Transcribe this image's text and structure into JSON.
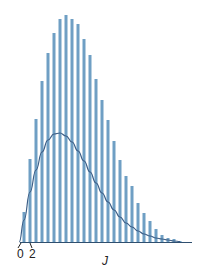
{
  "chart_data": {
    "type": "bar",
    "title": "",
    "xlabel": "J",
    "ylabel": "",
    "x_tick_labels": [
      "0",
      "2"
    ],
    "categories": [
      1,
      2,
      3,
      4,
      5,
      6,
      7,
      8,
      9,
      10,
      11,
      12,
      13,
      14,
      15,
      16,
      17,
      18,
      19,
      20,
      21,
      22,
      23,
      24,
      25,
      26,
      27
    ],
    "series": [
      {
        "name": "bars",
        "type": "bar",
        "color": "#6f9fc4",
        "values": [
          30,
          83,
          123,
          161,
          189,
          209,
          223,
          227,
          223,
          218,
          203,
          187,
          163,
          142,
          122,
          101,
          82,
          66,
          56,
          39,
          29,
          21,
          13,
          7,
          4,
          3,
          1
        ]
      },
      {
        "name": "curve",
        "type": "line",
        "color": "#3d5f87",
        "x": [
          0.2,
          1,
          2,
          3,
          4,
          5,
          6,
          7,
          8,
          9,
          10,
          11,
          12,
          13,
          14,
          15,
          16,
          17,
          18,
          19,
          20,
          21,
          22,
          23,
          24,
          25,
          26,
          27
        ],
        "values": [
          0,
          22,
          50,
          72,
          90,
          102,
          108,
          109,
          106,
          100,
          91,
          81,
          70,
          59,
          49,
          40,
          32,
          25,
          19,
          15,
          11,
          8,
          6,
          4,
          3,
          2,
          1,
          0.5
        ]
      }
    ],
    "grid": false,
    "legend": null,
    "axis": {
      "baseline_y_px": 242
    }
  },
  "labels": {
    "tick0": "0",
    "tick2": "2",
    "xlabel": "J"
  },
  "colors": {
    "bar": "#6f9fc4",
    "curve": "#3d5f87",
    "axis": "#2f4f6f"
  }
}
